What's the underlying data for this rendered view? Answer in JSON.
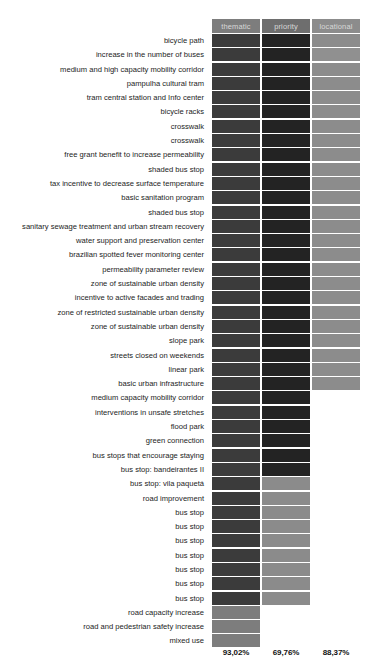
{
  "chart": {
    "title_clipped": "",
    "columns": [
      {
        "key": "thematic",
        "label": "thematic",
        "header_color": "#7d7d7d"
      },
      {
        "key": "priority",
        "label": "priority",
        "header_color": "#6e6e6e"
      },
      {
        "key": "locational",
        "label": "locational",
        "header_color": "#8c8c8c"
      }
    ],
    "totals": [
      {
        "column": "thematic",
        "value": "93,02%"
      },
      {
        "column": "priority",
        "value": "69,76%"
      },
      {
        "column": "locational",
        "value": "88,37%"
      }
    ]
  },
  "chart_data": {
    "type": "heatmap",
    "title": "",
    "xlabel": "",
    "ylabel": "",
    "grid": false,
    "legend_position": "none",
    "columns": [
      "thematic",
      "priority",
      "locational"
    ],
    "color_scale": {
      "filled_dark": "#3a3a3a",
      "filled_darker": "#262626",
      "filled_mid": "#707070",
      "filled_light": "#8f8f8f",
      "empty": "#ffffff"
    },
    "column_totals": [
      "93,02%",
      "69,76%",
      "88,37%"
    ],
    "categories": [
      "bicycle path",
      "increase in the number of buses",
      "medium and high capacity mobility corridor",
      "pampulha cultural tram",
      "tram central station and Info center",
      "bicycle racks",
      "crosswalk",
      "crosswalk",
      "free grant benefit to increase permeability",
      "shaded bus stop",
      "tax incentive to decrease surface temperature",
      "basic sanitation program",
      "shaded bus stop",
      "sanitary sewage treatment and urban stream recovery",
      "water support and preservation center",
      "brazilian spotted fever monitoring center",
      "permeability parameter review",
      "zone of sustainable urban density",
      "incentive to active facades and trading",
      "zone of restricted sustainable urban density",
      "zone of sustainable urban density",
      "slope park",
      "streets closed on weekends",
      "linear park",
      "basic urban infrastructure",
      "medium capacity mobility corridor",
      "interventions in unsafe stretches",
      "flood park",
      "green connection",
      "bus stops that encourage staying",
      "bus stop: bandeirantes II",
      "bus stop: vila paquetá",
      "road improvement",
      "bus stop",
      "bus stop",
      "bus stop",
      "bus stop",
      "bus stop",
      "bus stop",
      "bus stop",
      "road capacity increase",
      "road and pedestrian safety increase",
      "mixed use"
    ],
    "rows": [
      {
        "label": "bicycle path",
        "thematic": "#3b3b3b",
        "priority": "#232323",
        "locational": "#8c8c8c"
      },
      {
        "label": "increase in the number of buses",
        "thematic": "#3b3b3b",
        "priority": "#232323",
        "locational": "#909090"
      },
      {
        "label": "medium and high capacity mobility corridor",
        "thematic": "#3b3b3b",
        "priority": "#232323",
        "locational": "#8c8c8c"
      },
      {
        "label": "pampulha cultural tram",
        "thematic": "#3b3b3b",
        "priority": "#232323",
        "locational": "#8c8c8c"
      },
      {
        "label": "tram central station and Info center",
        "thematic": "#3b3b3b",
        "priority": "#232323",
        "locational": "#8c8c8c"
      },
      {
        "label": "bicycle racks",
        "thematic": "#3b3b3b",
        "priority": "#232323",
        "locational": "#8c8c8c"
      },
      {
        "label": "crosswalk",
        "thematic": "#3b3b3b",
        "priority": "#232323",
        "locational": "#8c8c8c"
      },
      {
        "label": "crosswalk",
        "thematic": "#3b3b3b",
        "priority": "#232323",
        "locational": "#8c8c8c"
      },
      {
        "label": "free grant benefit to increase permeability",
        "thematic": "#3b3b3b",
        "priority": "#232323",
        "locational": "#8c8c8c"
      },
      {
        "label": "shaded bus stop",
        "thematic": "#3b3b3b",
        "priority": "#232323",
        "locational": "#8c8c8c"
      },
      {
        "label": "tax incentive to decrease surface temperature",
        "thematic": "#3b3b3b",
        "priority": "#232323",
        "locational": "#8c8c8c"
      },
      {
        "label": "basic sanitation program",
        "thematic": "#3b3b3b",
        "priority": "#232323",
        "locational": "#8c8c8c"
      },
      {
        "label": "shaded bus stop",
        "thematic": "#3b3b3b",
        "priority": "#232323",
        "locational": "#8c8c8c"
      },
      {
        "label": "sanitary sewage treatment and urban stream recovery",
        "thematic": "#3b3b3b",
        "priority": "#232323",
        "locational": "#8c8c8c"
      },
      {
        "label": "water support and preservation center",
        "thematic": "#3b3b3b",
        "priority": "#232323",
        "locational": "#8c8c8c"
      },
      {
        "label": "brazilian spotted fever monitoring center",
        "thematic": "#3b3b3b",
        "priority": "#232323",
        "locational": "#8c8c8c"
      },
      {
        "label": "permeability parameter review",
        "thematic": "#3b3b3b",
        "priority": "#232323",
        "locational": "#8c8c8c"
      },
      {
        "label": "zone of sustainable urban density",
        "thematic": "#3b3b3b",
        "priority": "#232323",
        "locational": "#8c8c8c"
      },
      {
        "label": "incentive to active facades and trading",
        "thematic": "#3b3b3b",
        "priority": "#232323",
        "locational": "#8c8c8c"
      },
      {
        "label": "zone of restricted sustainable urban density",
        "thematic": "#3b3b3b",
        "priority": "#232323",
        "locational": "#8c8c8c"
      },
      {
        "label": "zone of sustainable urban density",
        "thematic": "#3b3b3b",
        "priority": "#232323",
        "locational": "#8c8c8c"
      },
      {
        "label": "slope park",
        "thematic": "#3b3b3b",
        "priority": "#232323",
        "locational": "#8c8c8c"
      },
      {
        "label": "streets closed on weekends",
        "thematic": "#3b3b3b",
        "priority": "#232323",
        "locational": "#8c8c8c"
      },
      {
        "label": "linear park",
        "thematic": "#3b3b3b",
        "priority": "#232323",
        "locational": "#8c8c8c"
      },
      {
        "label": "basic urban infrastructure",
        "thematic": "#3b3b3b",
        "priority": "#232323",
        "locational": "#8c8c8c"
      },
      {
        "label": "medium capacity mobility corridor",
        "thematic": "#3b3b3b",
        "priority": "#232323",
        "locational": null
      },
      {
        "label": "interventions in unsafe stretches",
        "thematic": "#3b3b3b",
        "priority": "#232323",
        "locational": null
      },
      {
        "label": "flood park",
        "thematic": "#3b3b3b",
        "priority": "#232323",
        "locational": null
      },
      {
        "label": "green connection",
        "thematic": "#3b3b3b",
        "priority": "#232323",
        "locational": null
      },
      {
        "label": "bus stops that encourage staying",
        "thematic": "#3b3b3b",
        "priority": "#232323",
        "locational": null
      },
      {
        "label": "bus stop: bandeirantes II",
        "thematic": "#3b3b3b",
        "priority": "#232323",
        "locational": null
      },
      {
        "label": "bus stop: vila paquetá",
        "thematic": "#3b3b3b",
        "priority": "#8b8b8b",
        "locational": null
      },
      {
        "label": "road improvement",
        "thematic": "#3b3b3b",
        "priority": "#8b8b8b",
        "locational": null
      },
      {
        "label": "bus stop",
        "thematic": "#3b3b3b",
        "priority": "#8b8b8b",
        "locational": null
      },
      {
        "label": "bus stop",
        "thematic": "#3b3b3b",
        "priority": "#8b8b8b",
        "locational": null
      },
      {
        "label": "bus stop",
        "thematic": "#3b3b3b",
        "priority": "#8b8b8b",
        "locational": null
      },
      {
        "label": "bus stop",
        "thematic": "#3b3b3b",
        "priority": "#8b8b8b",
        "locational": null
      },
      {
        "label": "bus stop",
        "thematic": "#3b3b3b",
        "priority": "#8b8b8b",
        "locational": null
      },
      {
        "label": "bus stop",
        "thematic": "#3b3b3b",
        "priority": "#8b8b8b",
        "locational": null
      },
      {
        "label": "bus stop",
        "thematic": "#3b3b3b",
        "priority": "#8b8b8b",
        "locational": null
      },
      {
        "label": "road capacity increase",
        "thematic": "#7d7d7d",
        "priority": null,
        "locational": null
      },
      {
        "label": "road and pedestrian safety increase",
        "thematic": "#7d7d7d",
        "priority": null,
        "locational": null
      },
      {
        "label": "mixed use",
        "thematic": "#7d7d7d",
        "priority": null,
        "locational": null
      }
    ]
  }
}
